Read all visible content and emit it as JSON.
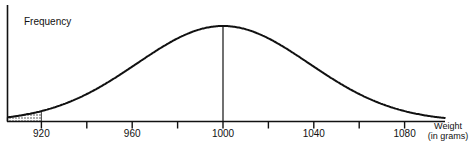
{
  "chart_data": {
    "type": "line",
    "title": "",
    "ylabel": "Frequency",
    "xlabel_line1": "Weight",
    "xlabel_line2": "(in grams)",
    "distribution": "normal",
    "mean": 1000,
    "sd": 38,
    "xlim": [
      905,
      1098
    ],
    "major_ticks": [
      920,
      960,
      1000,
      1040,
      1080
    ],
    "minor_ticks": [
      940,
      980,
      1020,
      1060
    ],
    "tick_labels": [
      "920",
      "960",
      "1000",
      "1040",
      "1080"
    ],
    "mean_line": 1000,
    "shaded_region": {
      "from": 905,
      "to": 920,
      "pattern": "stipple"
    },
    "grid": false,
    "legend": null
  },
  "labels": {
    "ylabel": "Frequency",
    "xlabel_line1": "Weight",
    "xlabel_line2": "(in grams)",
    "ticks": [
      "920",
      "960",
      "1000",
      "1040",
      "1080"
    ]
  }
}
